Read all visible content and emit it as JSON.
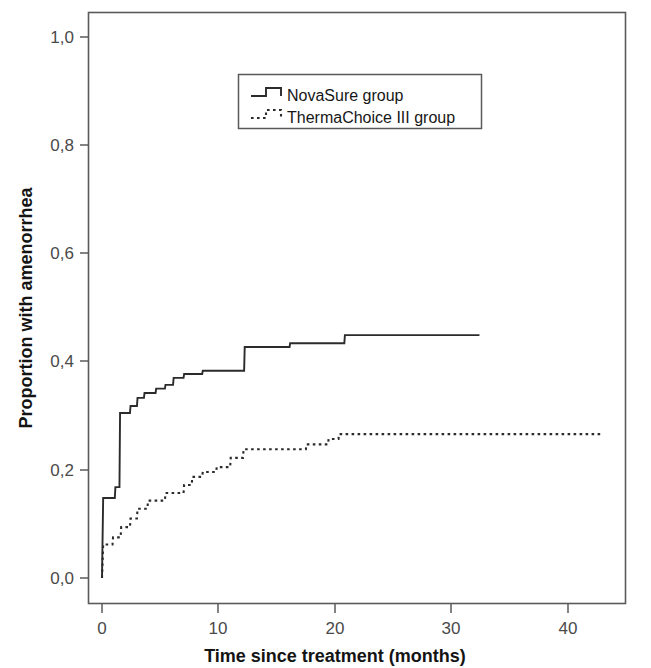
{
  "chart_data": {
    "type": "line",
    "title": "",
    "subtitle": "",
    "xlabel": "Time since treatment (months)",
    "ylabel": "Proportion with amenorrhea",
    "xlim": [
      -3,
      44
    ],
    "ylim": [
      -0.035,
      1.05
    ],
    "xticks": [
      0,
      10,
      20,
      30,
      40
    ],
    "xtick_labels": [
      "0",
      "10",
      "20",
      "30",
      "40"
    ],
    "yticks": [
      0.0,
      0.2,
      0.4,
      0.6,
      0.8,
      1.0
    ],
    "ytick_labels": [
      "0,0",
      "0,2",
      "0,4",
      "0,6",
      "0,8",
      "1,0"
    ],
    "grid": false,
    "legend_position": "upper center",
    "curve_style": "kaplan-meier step (cumulative incidence)",
    "series": [
      {
        "name": "NovaSure group",
        "style": "solid",
        "color": "#2b2b2b",
        "points": [
          [
            0.0,
            0.0
          ],
          [
            0.1,
            0.148
          ],
          [
            1.1,
            0.148
          ],
          [
            1.15,
            0.168
          ],
          [
            1.5,
            0.168
          ],
          [
            1.55,
            0.305
          ],
          [
            2.4,
            0.305
          ],
          [
            2.45,
            0.318
          ],
          [
            3.0,
            0.318
          ],
          [
            3.05,
            0.333
          ],
          [
            3.6,
            0.333
          ],
          [
            3.65,
            0.342
          ],
          [
            4.6,
            0.342
          ],
          [
            4.65,
            0.35
          ],
          [
            5.4,
            0.35
          ],
          [
            5.45,
            0.357
          ],
          [
            6.1,
            0.357
          ],
          [
            6.15,
            0.37
          ],
          [
            7.0,
            0.37
          ],
          [
            7.05,
            0.377
          ],
          [
            8.6,
            0.377
          ],
          [
            8.65,
            0.383
          ],
          [
            12.2,
            0.383
          ],
          [
            12.25,
            0.427
          ],
          [
            16.1,
            0.427
          ],
          [
            16.15,
            0.434
          ],
          [
            20.8,
            0.434
          ],
          [
            20.85,
            0.449
          ],
          [
            32.4,
            0.449
          ]
        ]
      },
      {
        "name": "ThermaChoice III group",
        "style": "dotted",
        "color": "#2b2b2b",
        "points": [
          [
            0.0,
            0.0
          ],
          [
            0.1,
            0.062
          ],
          [
            0.9,
            0.062
          ],
          [
            0.95,
            0.075
          ],
          [
            1.6,
            0.075
          ],
          [
            1.65,
            0.094
          ],
          [
            2.4,
            0.094
          ],
          [
            2.45,
            0.11
          ],
          [
            3.0,
            0.11
          ],
          [
            3.05,
            0.128
          ],
          [
            3.9,
            0.128
          ],
          [
            3.95,
            0.143
          ],
          [
            5.4,
            0.143
          ],
          [
            5.45,
            0.157
          ],
          [
            7.0,
            0.157
          ],
          [
            7.05,
            0.172
          ],
          [
            7.7,
            0.172
          ],
          [
            7.75,
            0.187
          ],
          [
            8.6,
            0.187
          ],
          [
            8.65,
            0.196
          ],
          [
            9.8,
            0.196
          ],
          [
            9.85,
            0.205
          ],
          [
            11.0,
            0.205
          ],
          [
            11.05,
            0.222
          ],
          [
            12.1,
            0.222
          ],
          [
            12.15,
            0.238
          ],
          [
            17.5,
            0.238
          ],
          [
            17.55,
            0.247
          ],
          [
            19.4,
            0.247
          ],
          [
            19.45,
            0.257
          ],
          [
            20.3,
            0.257
          ],
          [
            20.35,
            0.266
          ],
          [
            43.0,
            0.266
          ]
        ]
      }
    ],
    "legend": [
      {
        "label": "NovaSure group",
        "style": "solid"
      },
      {
        "label": "ThermaChoice III group",
        "style": "dotted"
      }
    ],
    "annotations": []
  }
}
